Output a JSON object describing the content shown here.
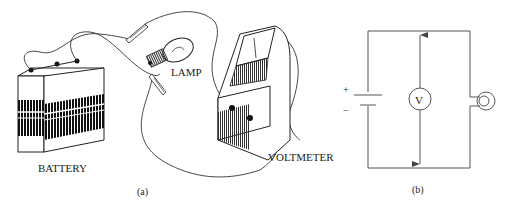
{
  "figure": {
    "panel_a": {
      "caption": "(a)",
      "labels": {
        "battery": "BATTERY",
        "lamp": "LAMP",
        "voltmeter": "VOLTMETER"
      }
    },
    "panel_b": {
      "caption": "(b)",
      "voltmeter_symbol": "V",
      "battery_plus": "+",
      "battery_minus": "−"
    }
  },
  "colors": {
    "ink": "#222222",
    "light_line": "#555555",
    "background": "#ffffff"
  }
}
